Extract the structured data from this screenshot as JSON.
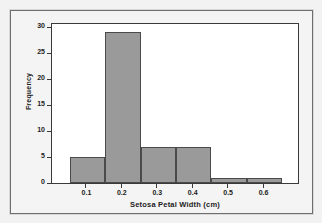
{
  "figure": {
    "background_color": "#f4f4f4",
    "border_color": "#6e6e6e",
    "plot_background_color": "#ffffff"
  },
  "chart_data": {
    "type": "bar",
    "title": "",
    "xlabel": "Setosa Petal Width (cm)",
    "ylabel": "Frequency",
    "bar_color": "#9a9a9a",
    "bar_edge_color": "#4a4a4a",
    "grid": false,
    "legend": null,
    "bin_width": 0.1,
    "bin_edges": [
      0.05,
      0.15,
      0.25,
      0.35,
      0.45,
      0.55,
      0.65
    ],
    "categories": [
      "0.05-0.15",
      "0.15-0.25",
      "0.25-0.35",
      "0.35-0.45",
      "0.45-0.55",
      "0.55-0.65"
    ],
    "bin_centers": [
      0.1,
      0.2,
      0.3,
      0.4,
      0.5,
      0.6
    ],
    "values": [
      5,
      29,
      7,
      7,
      1,
      1
    ],
    "xlim": [
      0.0,
      0.7
    ],
    "ylim": [
      0,
      31
    ],
    "xticks": [
      0.1,
      0.2,
      0.3,
      0.4,
      0.5,
      0.6
    ],
    "xtick_labels": [
      "0.1",
      "0.2",
      "0.3",
      "0.4",
      "0.5",
      "0.6"
    ],
    "yticks": [
      0,
      5,
      10,
      15,
      20,
      25,
      30
    ],
    "ytick_labels": [
      "0",
      "5",
      "10",
      "15",
      "20",
      "25",
      "30"
    ]
  }
}
